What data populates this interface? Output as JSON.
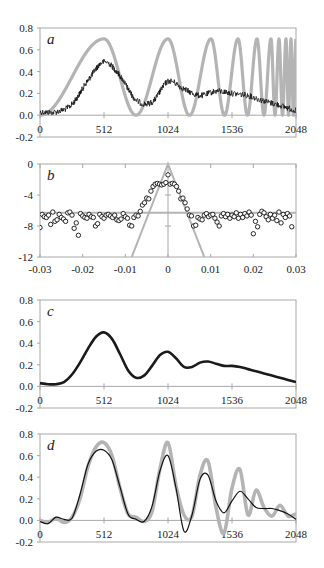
{
  "chart_data": [
    {
      "id": "a",
      "type": "line",
      "panel_label": "a",
      "title": "",
      "xlabel": "",
      "ylabel": "",
      "xlim": [
        0,
        2048
      ],
      "ylim": [
        -0.2,
        0.8
      ],
      "x_ticks": [
        "0",
        "512",
        "1024",
        "1536",
        "2048"
      ],
      "y_ticks": [
        "0.8",
        "0.6",
        "0.4",
        "0.2",
        "0.0",
        "-0.2"
      ],
      "x_tick_values": [
        0,
        512,
        1024,
        1536,
        2048
      ],
      "y_tick_values": [
        0.8,
        0.6,
        0.4,
        0.2,
        0.0,
        -0.2
      ],
      "grid": false,
      "series": [
        {
          "name": "reference (chirp)",
          "color": "#b4b4b4",
          "style": "thick",
          "peaks_x": [
            512,
            1024,
            1368,
            1584,
            1736,
            1848,
            1912,
            1968,
            2008
          ],
          "peak_value": 0.7,
          "trough_value": 0.0
        },
        {
          "name": "noisy measurement",
          "color": "#111111",
          "style": "thin-noisy",
          "x": [
            0,
            128,
            256,
            384,
            512,
            640,
            768,
            896,
            1024,
            1152,
            1280,
            1408,
            1536,
            1664,
            1792,
            1920,
            2048
          ],
          "y": [
            0.03,
            0.03,
            0.1,
            0.32,
            0.49,
            0.36,
            0.14,
            0.12,
            0.31,
            0.24,
            0.18,
            0.22,
            0.2,
            0.18,
            0.13,
            0.09,
            0.04
          ]
        }
      ]
    },
    {
      "id": "b",
      "type": "scatter",
      "panel_label": "b",
      "title": "",
      "xlabel": "",
      "ylabel": "",
      "xlim": [
        -0.03,
        0.03
      ],
      "ylim": [
        -12,
        0
      ],
      "x_ticks": [
        "-0.03",
        "-0.02",
        "-0.01",
        "0",
        "0.01",
        "0.02",
        "0.03"
      ],
      "y_ticks": [
        "0",
        "-4",
        "-8",
        "-12"
      ],
      "x_tick_values": [
        -0.03,
        -0.02,
        -0.01,
        0,
        0.01,
        0.02,
        0.03
      ],
      "y_tick_values": [
        0,
        -4,
        -8,
        -12
      ],
      "grid": false,
      "series": [
        {
          "name": "triangle",
          "color": "#b4b4b4",
          "style": "line",
          "x": [
            -0.0085,
            0,
            0.0085
          ],
          "y": [
            -12,
            0,
            -12
          ]
        },
        {
          "name": "noise floor",
          "color": "#b4b4b4",
          "style": "line",
          "x": [
            -0.03,
            0.03
          ],
          "y": [
            -6.3,
            -6.3
          ]
        },
        {
          "name": "samples",
          "color": "#111111",
          "style": "open-circles",
          "x": [
            -0.03,
            -0.0295,
            -0.029,
            -0.0285,
            -0.028,
            -0.0275,
            -0.027,
            -0.0265,
            -0.026,
            -0.0255,
            -0.025,
            -0.0245,
            -0.024,
            -0.0235,
            -0.023,
            -0.0225,
            -0.022,
            -0.0215,
            -0.021,
            -0.0205,
            -0.02,
            -0.0195,
            -0.019,
            -0.0185,
            -0.018,
            -0.0175,
            -0.017,
            -0.0165,
            -0.016,
            -0.0155,
            -0.015,
            -0.0145,
            -0.014,
            -0.0135,
            -0.013,
            -0.0125,
            -0.012,
            -0.0115,
            -0.011,
            -0.0105,
            -0.01,
            -0.0095,
            -0.009,
            -0.0085,
            -0.008,
            -0.0075,
            -0.007,
            -0.0065,
            -0.006,
            -0.0055,
            -0.005,
            -0.0045,
            -0.004,
            -0.0035,
            -0.003,
            -0.0025,
            -0.002,
            -0.0015,
            -0.001,
            -0.0005,
            0.0,
            0.0005,
            0.001,
            0.0015,
            0.002,
            0.0025,
            0.003,
            0.0035,
            0.004,
            0.0045,
            0.005,
            0.0055,
            0.006,
            0.0065,
            0.007,
            0.0075,
            0.008,
            0.0085,
            0.009,
            0.0095,
            0.01,
            0.0105,
            0.011,
            0.0115,
            0.012,
            0.0125,
            0.013,
            0.0135,
            0.014,
            0.0145,
            0.015,
            0.0155,
            0.016,
            0.0165,
            0.017,
            0.0175,
            0.018,
            0.0185,
            0.019,
            0.0195,
            0.02,
            0.0205,
            0.021,
            0.0215,
            0.022,
            0.0225,
            0.023,
            0.0235,
            0.024,
            0.0245,
            0.025,
            0.0255,
            0.026,
            0.0265,
            0.027,
            0.0275,
            0.028,
            0.0285,
            0.029,
            0.0295,
            0.03
          ],
          "y": [
            -8.2,
            -6.5,
            -6.8,
            -6.9,
            -6.6,
            -7.8,
            -6.2,
            -7.4,
            -7.2,
            -6.5,
            -6.9,
            -7.1,
            -7.4,
            -6.3,
            -6.2,
            -6.6,
            -8.3,
            -7.6,
            -9.2,
            -6.4,
            -6.7,
            -6.9,
            -7.0,
            -6.5,
            -6.8,
            -6.9,
            -8.0,
            -7.7,
            -6.5,
            -6.8,
            -7.0,
            -6.6,
            -6.5,
            -6.7,
            -6.9,
            -6.6,
            -7.2,
            -7.3,
            -7.1,
            -6.4,
            -6.8,
            -7.0,
            -7.9,
            -8.0,
            -6.9,
            -6.6,
            -6.7,
            -6.1,
            -5.3,
            -5.0,
            -4.4,
            -4.5,
            -3.5,
            -2.9,
            -2.6,
            -2.5,
            -2.6,
            -2.7,
            -2.6,
            -2.4,
            -1.4,
            -2.6,
            -2.5,
            -2.6,
            -2.9,
            -3.5,
            -4.5,
            -4.4,
            -5.0,
            -5.8,
            -6.6,
            -6.7,
            -8.0,
            -7.9,
            -6.9,
            -7.1,
            -7.2,
            -6.6,
            -6.4,
            -6.8,
            -6.6,
            -6.5,
            -7.0,
            -7.5,
            -8.0,
            -6.7,
            -6.4,
            -6.8,
            -6.5,
            -7.0,
            -6.6,
            -6.8,
            -6.3,
            -7.0,
            -6.5,
            -6.9,
            -6.4,
            -6.7,
            -6.2,
            -6.6,
            -9.0,
            -7.4,
            -8.1,
            -6.5,
            -6.1,
            -6.3,
            -6.8,
            -7.2,
            -6.5,
            -7.0,
            -6.6,
            -7.3,
            -6.2,
            -7.6,
            -6.5,
            -6.9,
            -6.4,
            -6.7,
            -8.1
          ]
        }
      ]
    },
    {
      "id": "c",
      "type": "line",
      "panel_label": "c",
      "title": "",
      "xlabel": "",
      "ylabel": "",
      "xlim": [
        0,
        2048
      ],
      "ylim": [
        -0.2,
        0.8
      ],
      "x_ticks": [
        "0",
        "512",
        "1024",
        "1536",
        "2048"
      ],
      "y_ticks": [
        "0.8",
        "0.6",
        "0.4",
        "0.2",
        "0.0",
        "-0.2"
      ],
      "x_tick_values": [
        0,
        512,
        1024,
        1536,
        2048
      ],
      "y_tick_values": [
        0.8,
        0.6,
        0.4,
        0.2,
        0.0,
        -0.2
      ],
      "grid": false,
      "series": [
        {
          "name": "smoothed estimate",
          "color": "#1a1a1a",
          "style": "thick",
          "x": [
            0,
            64,
            128,
            192,
            256,
            320,
            384,
            448,
            512,
            576,
            640,
            704,
            768,
            832,
            896,
            960,
            1024,
            1088,
            1152,
            1216,
            1280,
            1344,
            1408,
            1472,
            1536,
            1600,
            1664,
            1728,
            1792,
            1856,
            1920,
            1984,
            2048
          ],
          "y": [
            0.03,
            0.02,
            0.02,
            0.04,
            0.11,
            0.22,
            0.35,
            0.46,
            0.5,
            0.44,
            0.3,
            0.15,
            0.08,
            0.1,
            0.19,
            0.29,
            0.32,
            0.26,
            0.18,
            0.18,
            0.22,
            0.23,
            0.21,
            0.19,
            0.19,
            0.18,
            0.16,
            0.14,
            0.12,
            0.1,
            0.08,
            0.06,
            0.04
          ]
        }
      ]
    },
    {
      "id": "d",
      "type": "line",
      "panel_label": "d",
      "title": "",
      "xlabel": "",
      "ylabel": "",
      "xlim": [
        0,
        2048
      ],
      "ylim": [
        -0.2,
        0.8
      ],
      "x_ticks": [
        "0",
        "512",
        "1024",
        "1536",
        "2048"
      ],
      "y_ticks": [
        "0.8",
        "0.6",
        "0.4",
        "0.2",
        "0.0",
        "-0.2"
      ],
      "x_tick_values": [
        0,
        512,
        1024,
        1536,
        2048
      ],
      "y_tick_values": [
        0.8,
        0.6,
        0.4,
        0.2,
        0.0,
        -0.2
      ],
      "grid": false,
      "series": [
        {
          "name": "reference (band-limited)",
          "color": "#b4b4b4",
          "style": "thick",
          "x": [
            0,
            64,
            128,
            192,
            256,
            320,
            384,
            448,
            512,
            576,
            640,
            704,
            768,
            832,
            896,
            960,
            1024,
            1088,
            1152,
            1216,
            1280,
            1344,
            1408,
            1472,
            1536,
            1600,
            1664,
            1728,
            1792,
            1856,
            1920,
            1984,
            2048
          ],
          "y": [
            0.0,
            -0.02,
            0.02,
            -0.02,
            0.03,
            0.2,
            0.5,
            0.68,
            0.72,
            0.6,
            0.3,
            0.06,
            0.03,
            -0.01,
            0.08,
            0.48,
            0.72,
            0.32,
            0.05,
            0.04,
            0.42,
            0.55,
            0.12,
            -0.12,
            0.3,
            0.47,
            0.05,
            0.28,
            0.12,
            0.04,
            0.14,
            0.04,
            0.06
          ]
        },
        {
          "name": "reconstruction",
          "color": "#111111",
          "style": "thin",
          "x": [
            0,
            64,
            128,
            192,
            256,
            320,
            384,
            448,
            512,
            576,
            640,
            704,
            768,
            832,
            896,
            960,
            1024,
            1088,
            1152,
            1216,
            1280,
            1344,
            1408,
            1472,
            1536,
            1600,
            1664,
            1728,
            1792,
            1856,
            1920,
            1984,
            2048
          ],
          "y": [
            -0.01,
            -0.03,
            0.03,
            0.01,
            0.02,
            0.24,
            0.52,
            0.64,
            0.65,
            0.56,
            0.31,
            0.06,
            0.01,
            -0.01,
            0.13,
            0.46,
            0.6,
            0.3,
            -0.1,
            0.05,
            0.38,
            0.42,
            0.18,
            0.07,
            0.18,
            0.27,
            0.2,
            0.12,
            0.11,
            0.11,
            0.09,
            0.06,
            0.01
          ]
        }
      ]
    }
  ]
}
